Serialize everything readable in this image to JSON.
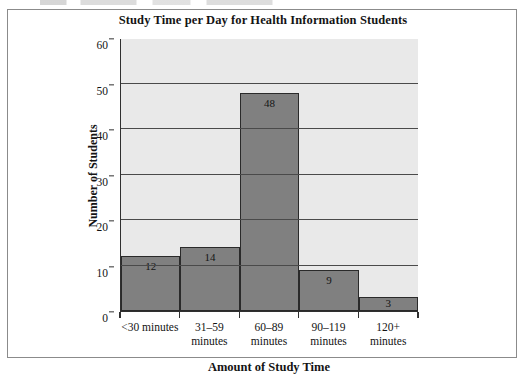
{
  "figure": {
    "title": "Study Time per Day for Health Information Students"
  },
  "chart_data": {
    "type": "bar",
    "title": "Study Time per Day for Health Information Students",
    "xlabel": "Amount of Study Time",
    "ylabel": "Number of Students",
    "categories": [
      "<30 minutes",
      "31–59 minutes",
      "60–89 minutes",
      "90–119 minutes",
      "120+ minutes"
    ],
    "category_lines": [
      [
        "<30 minutes"
      ],
      [
        "31–59",
        "minutes"
      ],
      [
        "60–89",
        "minutes"
      ],
      [
        "90–119",
        "minutes"
      ],
      [
        "120+",
        "minutes"
      ]
    ],
    "values": [
      12,
      14,
      48,
      9,
      3
    ],
    "value_labels": [
      "12",
      "14",
      "48",
      "9",
      "3"
    ],
    "ylim": [
      0,
      60
    ],
    "ytick_labels": [
      "0",
      "10",
      "20",
      "30",
      "40",
      "50",
      "60"
    ],
    "ytick_values": [
      0,
      10,
      20,
      30,
      40,
      50,
      60
    ],
    "grid": "horizontal",
    "legend": "none",
    "bar_gap": 0,
    "colors": {
      "bar_fill": "#808080",
      "bar_edge": "#2a2a2a",
      "plot_background": "#e9e9e9",
      "gridline": "#4a4a4a",
      "axis": "#303030",
      "text": "#141414",
      "frame": "#8b8b8b"
    }
  }
}
